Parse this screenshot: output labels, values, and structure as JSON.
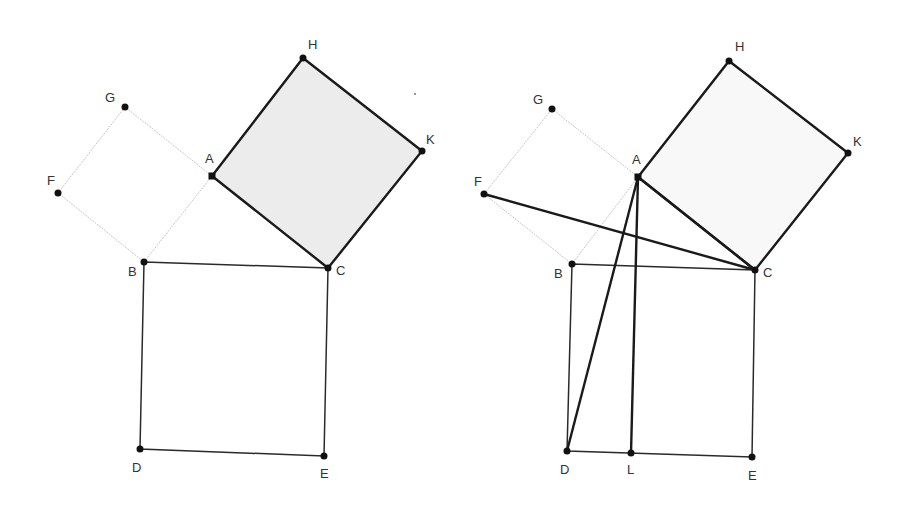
{
  "figure": {
    "title": "",
    "panels": [
      {
        "id": "left",
        "description": "Right triangle ABC with squares on each side; square ACKH shaded",
        "points": {
          "H": {
            "x": 303,
            "y": 58,
            "label": "H"
          },
          "G": {
            "x": 125,
            "y": 107,
            "label": "G"
          },
          "K": {
            "x": 422,
            "y": 151,
            "label": "K"
          },
          "A": {
            "x": 212,
            "y": 176,
            "label": "A"
          },
          "F": {
            "x": 58,
            "y": 193,
            "label": "F"
          },
          "B": {
            "x": 144,
            "y": 262,
            "label": "B"
          },
          "C": {
            "x": 328,
            "y": 268,
            "label": "C"
          },
          "D": {
            "x": 140,
            "y": 449,
            "label": "D"
          },
          "E": {
            "x": 324,
            "y": 456,
            "label": "E"
          }
        }
      },
      {
        "id": "right",
        "description": "Same construction with segments FC, AD and AL added",
        "points": {
          "H": {
            "x": 729,
            "y": 61,
            "label": "H"
          },
          "G": {
            "x": 552,
            "y": 109,
            "label": "G"
          },
          "K": {
            "x": 848,
            "y": 153,
            "label": "K"
          },
          "A": {
            "x": 638,
            "y": 177,
            "label": "A"
          },
          "F": {
            "x": 484,
            "y": 194,
            "label": "F"
          },
          "B": {
            "x": 572,
            "y": 264,
            "label": "B"
          },
          "C": {
            "x": 755,
            "y": 270,
            "label": "C"
          },
          "D": {
            "x": 567,
            "y": 451,
            "label": "D"
          },
          "L": {
            "x": 631,
            "y": 453,
            "label": "L"
          },
          "E": {
            "x": 752,
            "y": 457,
            "label": "E"
          }
        }
      }
    ],
    "colors": {
      "shade": "#ececec",
      "line": "#1a1a1a",
      "faint": "#c8c8c8"
    }
  }
}
